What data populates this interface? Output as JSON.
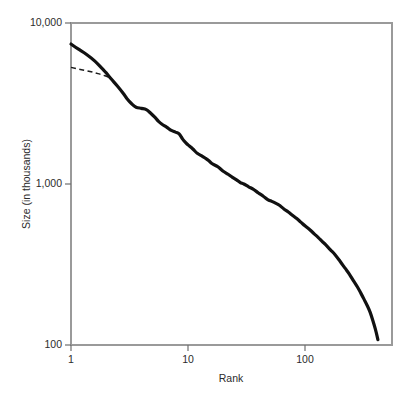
{
  "chart_data": {
    "type": "line",
    "title": "",
    "subtitle": "",
    "xlabel": "Rank",
    "ylabel": "Size (in thousands)",
    "xscale": "log",
    "yscale": "log",
    "xlim": [
      1,
      450
    ],
    "ylim": [
      100,
      10000
    ],
    "grid": false,
    "legend_position": "none",
    "annotations": [],
    "xticks": [
      {
        "value": 1,
        "label": "1"
      },
      {
        "value": 10,
        "label": "10"
      },
      {
        "value": 100,
        "label": "100"
      }
    ],
    "yticks": [
      {
        "value": 100,
        "label": "100"
      },
      {
        "value": 1000,
        "label": "1,000"
      },
      {
        "value": 10000,
        "label": "10,000"
      }
    ],
    "series": [
      {
        "name": "rank-size-curve",
        "style": "solid",
        "color": "#111111",
        "width": 3.2,
        "x": [
          1,
          1.15,
          1.35,
          1.6,
          1.85,
          2.0,
          2.2,
          2.5,
          2.8,
          3.0,
          3.3,
          3.6,
          4.0,
          4.4,
          4.8,
          5.2,
          5.6,
          6.0,
          6.6,
          7.2,
          7.8,
          8.4,
          9.0,
          9.6,
          10.0,
          11,
          12,
          13,
          14,
          15,
          16,
          18,
          20,
          22,
          24,
          26,
          28,
          30,
          33,
          36,
          40,
          44,
          48,
          52,
          56,
          60,
          66,
          72,
          78,
          85,
          92,
          100,
          110,
          120,
          130,
          140,
          150,
          165,
          180,
          200,
          220,
          240,
          260,
          280,
          300,
          320,
          340,
          360,
          380,
          400,
          420
        ],
        "y": [
          7400,
          6900,
          6400,
          5800,
          5200,
          4900,
          4500,
          4050,
          3650,
          3400,
          3150,
          3000,
          2950,
          2900,
          2750,
          2600,
          2450,
          2350,
          2250,
          2150,
          2100,
          2050,
          1900,
          1800,
          1750,
          1650,
          1550,
          1500,
          1450,
          1400,
          1340,
          1280,
          1200,
          1150,
          1100,
          1060,
          1020,
          1000,
          960,
          930,
          880,
          840,
          800,
          780,
          760,
          740,
          700,
          670,
          640,
          610,
          580,
          550,
          520,
          490,
          465,
          440,
          420,
          390,
          365,
          330,
          300,
          275,
          250,
          230,
          210,
          192,
          176,
          160,
          142,
          125,
          108
        ]
      },
      {
        "name": "reference-trend-dashed",
        "style": "dashed",
        "color": "#1b1b1b",
        "width": 1.5,
        "x": [
          1,
          1.2,
          1.45,
          1.7,
          1.95,
          2.2
        ],
        "y": [
          5300,
          5150,
          5000,
          4850,
          4700,
          4550
        ]
      }
    ]
  },
  "figure": {
    "background_color": "#ffffff",
    "frame_color": "#9a9a9a",
    "text_color": "#2b2b2b"
  }
}
